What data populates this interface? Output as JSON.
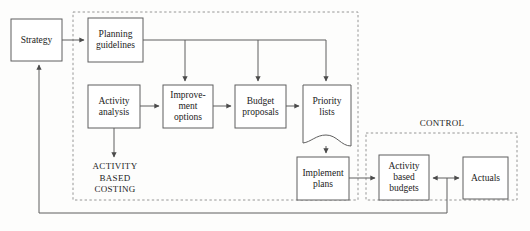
{
  "diagram": {
    "stroke_color": "#5f5f5f",
    "text_color": "#1b1b1b",
    "background_color": "#fdfdfc",
    "nodes": [
      {
        "id": "strategy",
        "label": "Strategy"
      },
      {
        "id": "planning_guidelines",
        "label": "Planning\nguidelines"
      },
      {
        "id": "activity_analysis",
        "label": "Activity\nanalysis"
      },
      {
        "id": "improvement_options",
        "label": "Improve-\nment\noptions"
      },
      {
        "id": "budget_proposals",
        "label": "Budget\nproposals"
      },
      {
        "id": "priority_lists",
        "label": "Priority\nlists"
      },
      {
        "id": "implement_plans",
        "label": "Implement\nplans"
      },
      {
        "id": "activity_based_budgets",
        "label": "Activity\nbased\nbudgets"
      },
      {
        "id": "actuals",
        "label": "Actuals"
      }
    ],
    "zones": [
      {
        "id": "abc_zone",
        "label": "ACTIVITY\nBASED\nCOSTING"
      },
      {
        "id": "control_zone",
        "label": "CONTROL"
      }
    ]
  }
}
